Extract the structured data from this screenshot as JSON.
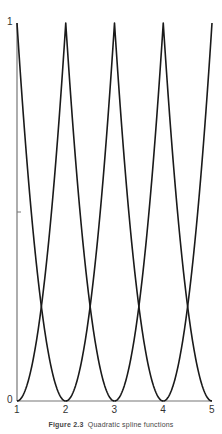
{
  "chart_data": {
    "type": "line",
    "title": "",
    "caption": {
      "label": "Figure 2.3",
      "text": "Quadratic spline functions"
    },
    "xlabel": "",
    "ylabel": "",
    "xlim": [
      1,
      5
    ],
    "ylim": [
      0,
      1
    ],
    "grid": false,
    "legend": null,
    "x_ticks": [
      "1",
      "2",
      "3",
      "4",
      "5"
    ],
    "y_ticks": [
      "0",
      "1"
    ],
    "y_minor_ticks": [
      0.5
    ],
    "series": [
      {
        "name": "basis centered at 1",
        "formula": "(1-|x-1|)^2",
        "support": [
          0,
          2
        ],
        "peak": [
          1,
          1
        ],
        "points": [
          [
            1,
            1
          ],
          [
            1.5,
            0.25
          ],
          [
            2,
            0
          ]
        ]
      },
      {
        "name": "basis centered at 2",
        "formula": "(1-|x-2|)^2",
        "support": [
          1,
          3
        ],
        "peak": [
          2,
          1
        ],
        "points": [
          [
            1,
            0
          ],
          [
            1.5,
            0.25
          ],
          [
            2,
            1
          ],
          [
            2.5,
            0.25
          ],
          [
            3,
            0
          ]
        ]
      },
      {
        "name": "basis centered at 3",
        "formula": "(1-|x-3|)^2",
        "support": [
          2,
          4
        ],
        "peak": [
          3,
          1
        ],
        "points": [
          [
            2,
            0
          ],
          [
            2.5,
            0.25
          ],
          [
            3,
            1
          ],
          [
            3.5,
            0.25
          ],
          [
            4,
            0
          ]
        ]
      },
      {
        "name": "basis centered at 4",
        "formula": "(1-|x-4|)^2",
        "support": [
          3,
          5
        ],
        "peak": [
          4,
          1
        ],
        "points": [
          [
            3,
            0
          ],
          [
            3.5,
            0.25
          ],
          [
            4,
            1
          ],
          [
            4.5,
            0.25
          ],
          [
            5,
            0
          ]
        ]
      },
      {
        "name": "basis centered at 5",
        "formula": "(1-|x-5|)^2",
        "support": [
          4,
          6
        ],
        "peak": [
          5,
          1
        ],
        "points": [
          [
            4,
            0
          ],
          [
            4.5,
            0.25
          ],
          [
            5,
            1
          ]
        ]
      }
    ],
    "crossings": [
      [
        1.5,
        0.25
      ],
      [
        2.5,
        0.25
      ],
      [
        3.5,
        0.25
      ],
      [
        4.5,
        0.25
      ]
    ]
  },
  "layout": {
    "x0_px": 17,
    "x1_px": 212,
    "y0_px": 401,
    "y1_px": 23,
    "line_color": "#1a1a1a",
    "axis_color": "#777777"
  }
}
